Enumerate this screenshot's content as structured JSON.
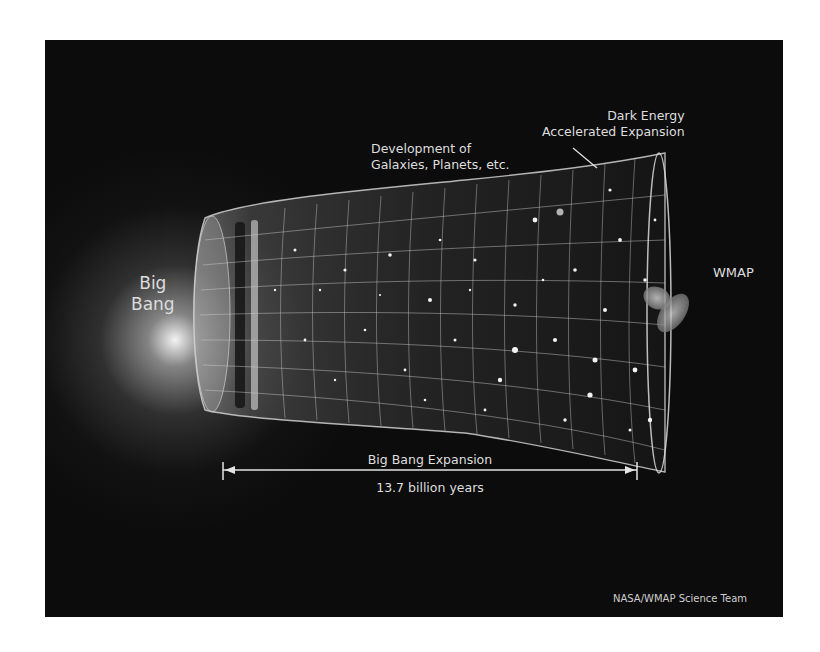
{
  "figure": {
    "background_color": "#0c0c0c",
    "page_background": "#ffffff",
    "text_color": "#dedede"
  },
  "labels": {
    "big_bang": {
      "line1": "Big",
      "line2": "Bang"
    },
    "development": {
      "line1": "Development of",
      "line2": "Galaxies, Planets, etc."
    },
    "dark_energy": {
      "line1": "Dark Energy",
      "line2": "Accelerated Expansion"
    },
    "wmap": "WMAP",
    "expansion_label": "Big Bang Expansion",
    "duration": "13.7 billion years",
    "credit": "NASA/WMAP Science Team"
  },
  "icons": {
    "big_bang_glow": "radial-glow",
    "universe_funnel": "expanding-grid-funnel",
    "wmap_satellite": "satellite",
    "timeline_arrow": "double-headed-arrow",
    "pointer_line": "leader-line"
  }
}
